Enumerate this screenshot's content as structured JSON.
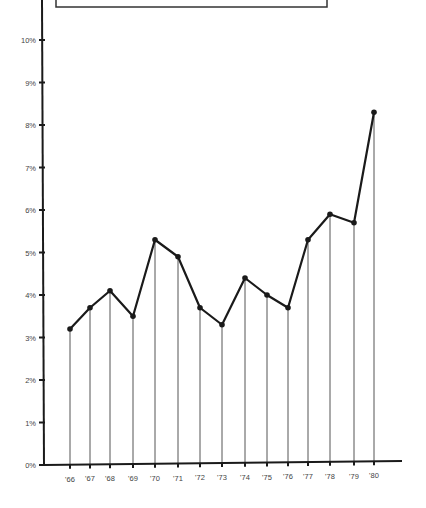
{
  "chart_data": {
    "type": "line",
    "title": "",
    "xlabel": "",
    "ylabel": "",
    "categories": [
      "'66",
      "'67",
      "'68",
      "'69",
      "'70",
      "'71",
      "'72",
      "'73",
      "'74",
      "'75",
      "'76",
      "'77",
      "'78",
      "'79",
      "'80"
    ],
    "series": [
      {
        "name": "Rate",
        "values": [
          3.2,
          3.7,
          4.1,
          3.5,
          5.3,
          4.9,
          3.7,
          3.3,
          4.4,
          4.0,
          3.7,
          5.3,
          5.9,
          5.7,
          8.3
        ]
      }
    ],
    "y_ticks": [
      "0%",
      "1%",
      "2%",
      "3%",
      "4%",
      "5%",
      "6%",
      "7%",
      "8%",
      "9%",
      "10%"
    ],
    "ylim": [
      0,
      10.8
    ],
    "grid": false,
    "legend": "none",
    "style": {
      "line_color": "#1a1a1a",
      "drop_line_color": "#555555",
      "axis_color": "#1a1a1a"
    }
  },
  "header_box": {
    "text": ""
  }
}
